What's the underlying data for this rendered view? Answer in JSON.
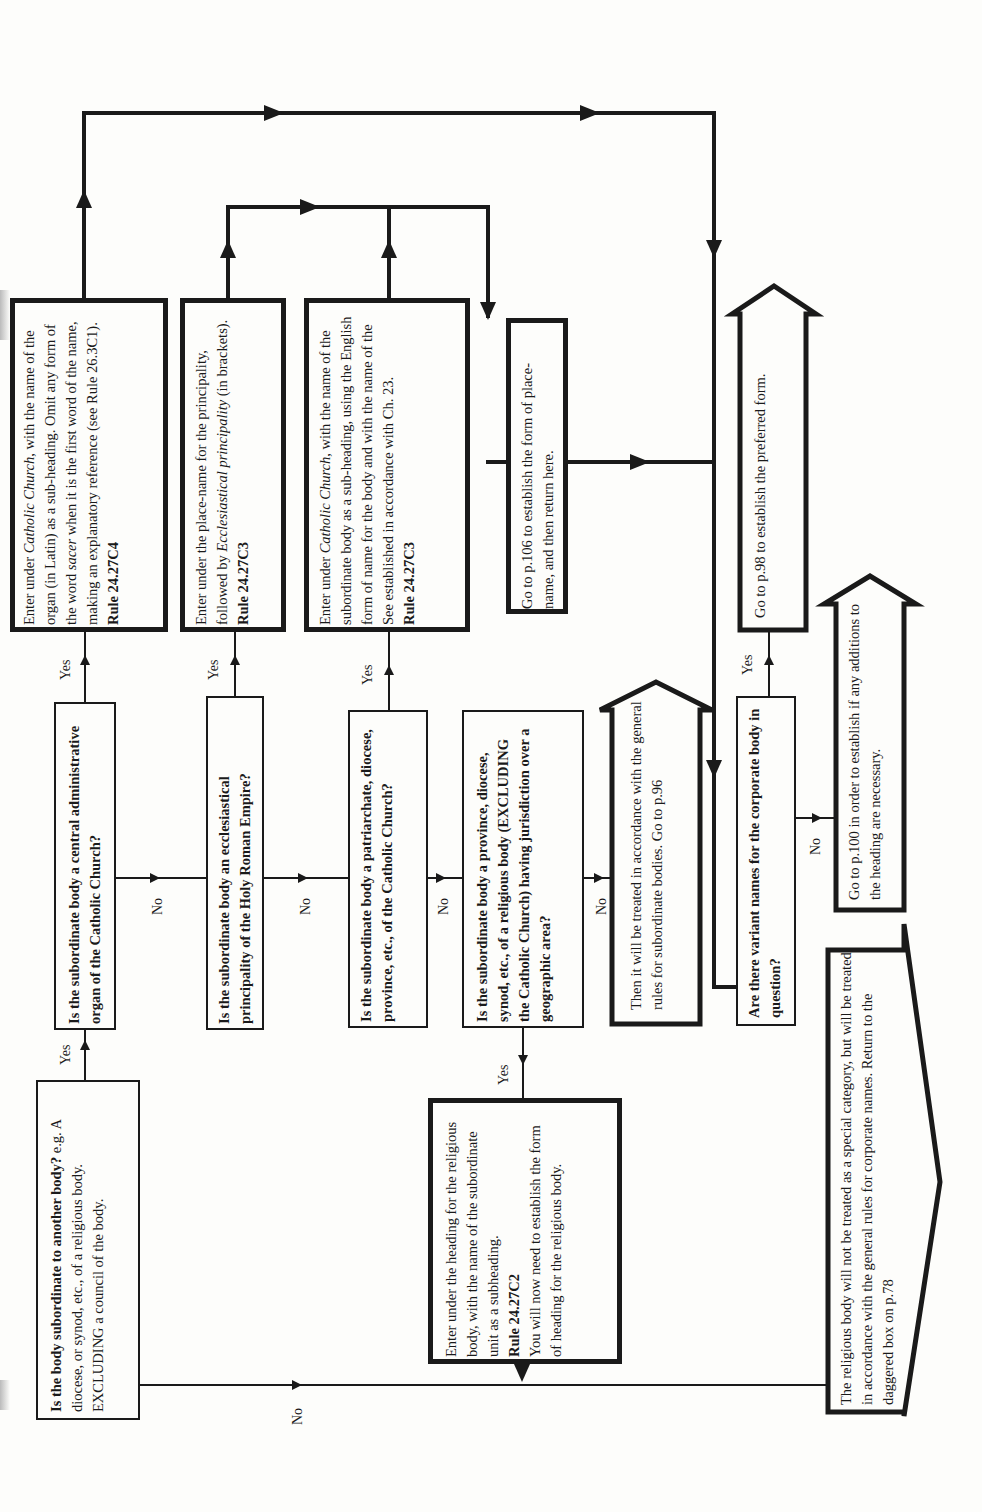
{
  "flowchart": {
    "orientation": "rotated-90-ccw",
    "labels": {
      "yes": "Yes",
      "no": "No"
    },
    "questions": [
      {
        "id": "q1",
        "text": "Is the body subordinate to another body?",
        "detail": "e.g. A diocese, or synod, etc., of a religious body. EXCLUDING a council of the body."
      },
      {
        "id": "q2",
        "text": "Is the subordinate body a central administrative organ of the Catholic Church?"
      },
      {
        "id": "q3",
        "text": "Is the subordinate body an ecclesiastical principality of the Holy Roman Empire?"
      },
      {
        "id": "q4",
        "text": "Is the subordinate body a patriarchate, diocese, province, etc., of the Catholic Church?"
      },
      {
        "id": "q5",
        "text": "Is the subordinate body a province, diocese, synod, etc., of a religious body (EXCLUDING the Catholic Church) having jurisdiction over a geographic area?"
      },
      {
        "id": "q6",
        "text": "Are there variant names for the corporate body in question?"
      }
    ],
    "actions": [
      {
        "id": "a1",
        "pre": "Enter under ",
        "italic": "Catholic Church",
        "post": ", with the name of the organ (in Latin) as a sub-heading. Omit any form of the word ",
        "italic2": "sacer",
        "post2": " when it is the first word of the name, making an explanatory reference (see Rule 26.3C1).",
        "rule": "Rule 24.27C4"
      },
      {
        "id": "a2",
        "pre": "Enter under the place-name for the principality, followed by ",
        "italic": "Ecclesiastical principality",
        "post": " (in brackets).",
        "rule": "Rule 24.27C3"
      },
      {
        "id": "a3",
        "pre": "Enter under ",
        "italic": "Catholic Church",
        "post": ", with the name of the subordinate body as a sub-heading, using the English form of name for the body and with the name of the See established in accordance with Ch. 23.",
        "rule": "Rule 24.27C3"
      },
      {
        "id": "a4",
        "text": "Go to p.106 to establish the form of place-name, and then return here."
      },
      {
        "id": "a5",
        "text": "Enter under the heading for the religious body, with the name of the subordinate unit as a subheading.",
        "rule": "Rule 24.27C2",
        "post": "You will now need to establish the form of heading for the religious body."
      }
    ],
    "exits": [
      {
        "id": "e1",
        "text": "Then it will be treated in accordance with the general rules for subordinate bodies. Go to p.96"
      },
      {
        "id": "e2",
        "text": "Go to p.98 to establish the preferred form."
      },
      {
        "id": "e3",
        "text": "Go to p.100 in order to establish if any additions to the heading are necessary."
      },
      {
        "id": "e4",
        "text": "The religious body will not be treated as a special category, but will be treated in accordance with the general rules for corporate names. Return to the daggered box on p.78"
      }
    ]
  }
}
